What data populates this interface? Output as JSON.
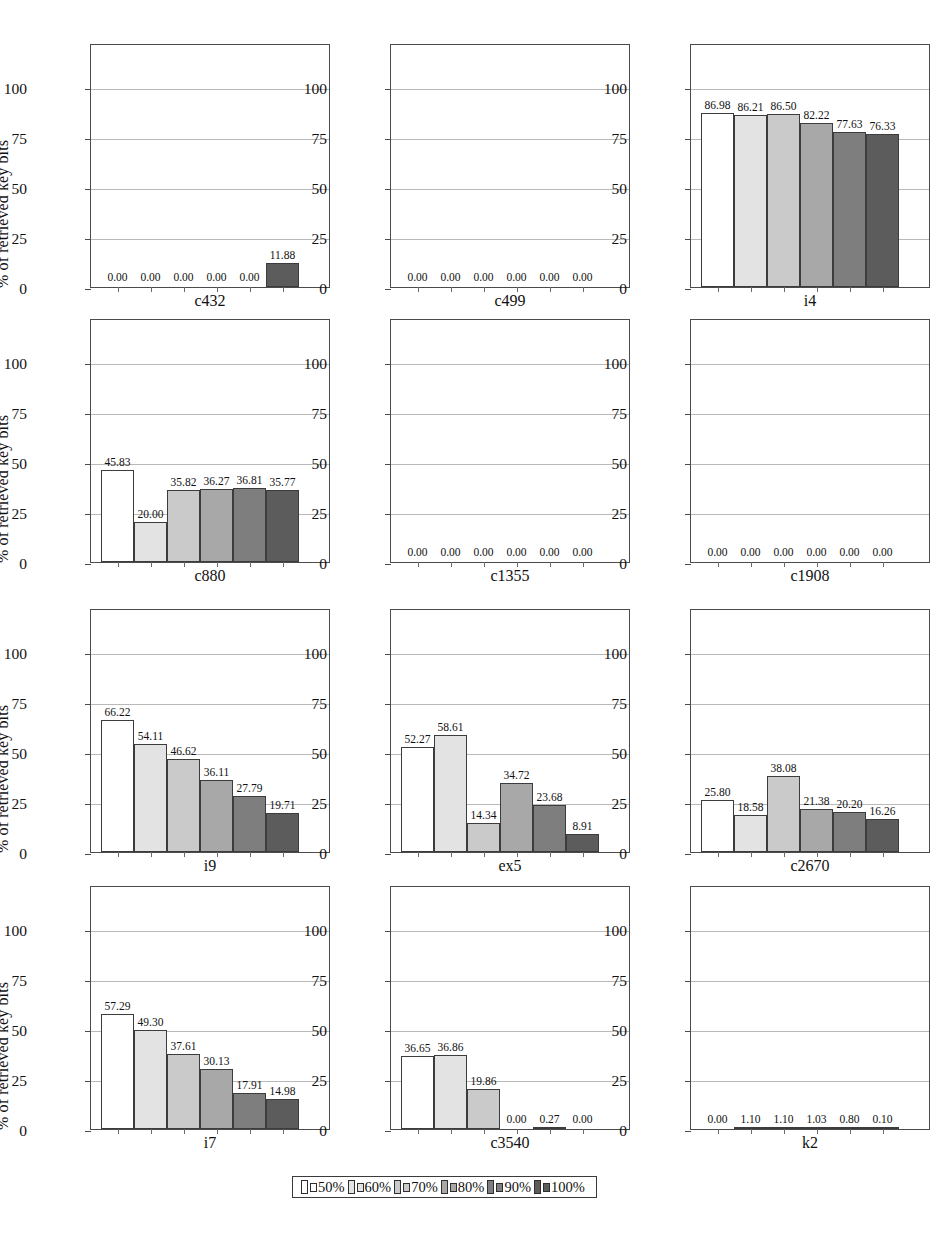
{
  "figure": {
    "ylabel": "% of retrieved key bits",
    "y_ticks": [
      "0",
      "25",
      "50",
      "75",
      "100"
    ],
    "y_tick_values": [
      0,
      25,
      50,
      75,
      100
    ],
    "ylim": [
      0,
      122
    ],
    "bar_shades": [
      "#ffffff",
      "#e3e3e3",
      "#cacaca",
      "#a8a8a8",
      "#7e7e7e",
      "#5c5c5c"
    ]
  },
  "legend": {
    "entries": [
      {
        "label": "50%",
        "color": "#ffffff"
      },
      {
        "label": "60%",
        "color": "#e3e3e3"
      },
      {
        "label": "70%",
        "color": "#cacaca"
      },
      {
        "label": "80%",
        "color": "#a8a8a8"
      },
      {
        "label": "90%",
        "color": "#7e7e7e"
      },
      {
        "label": "100%",
        "color": "#5c5c5c"
      }
    ]
  },
  "chart_data": {
    "type": "bar",
    "title": "",
    "xlabel": "",
    "ylabel": "% of retrieved key bits",
    "ylim": [
      0,
      122
    ],
    "grid": true,
    "legend_position": "bottom",
    "categories": [
      "50%",
      "60%",
      "70%",
      "80%",
      "90%",
      "100%"
    ],
    "panels": [
      {
        "name": "c432",
        "values": [
          0.0,
          0.0,
          0.0,
          0.0,
          0.0,
          11.88
        ],
        "labels": [
          "0.00",
          "0.00",
          "0.00",
          "0.00",
          "0.00",
          "11.88"
        ]
      },
      {
        "name": "c499",
        "values": [
          0.0,
          0.0,
          0.0,
          0.0,
          0.0,
          0.0
        ],
        "labels": [
          "0.00",
          "0.00",
          "0.00",
          "0.00",
          "0.00",
          "0.00"
        ]
      },
      {
        "name": "i4",
        "values": [
          86.98,
          86.21,
          86.5,
          82.22,
          77.63,
          76.33
        ],
        "labels": [
          "86.98",
          "86.21",
          "86.50",
          "82.22",
          "77.63",
          "76.33"
        ]
      },
      {
        "name": "c880",
        "values": [
          45.83,
          20.0,
          35.82,
          36.27,
          36.81,
          35.77
        ],
        "labels": [
          "45.83",
          "20.00",
          "35.82",
          "36.27",
          "36.81",
          "35.77"
        ]
      },
      {
        "name": "c1355",
        "values": [
          0.0,
          0.0,
          0.0,
          0.0,
          0.0,
          0.0
        ],
        "labels": [
          "0.00",
          "0.00",
          "0.00",
          "0.00",
          "0.00",
          "0.00"
        ]
      },
      {
        "name": "c1908",
        "values": [
          0.0,
          0.0,
          0.0,
          0.0,
          0.0,
          0.0
        ],
        "labels": [
          "0.00",
          "0.00",
          "0.00",
          "0.00",
          "0.00",
          "0.00"
        ]
      },
      {
        "name": "i9",
        "values": [
          66.22,
          54.11,
          46.62,
          36.11,
          27.79,
          19.71
        ],
        "labels": [
          "66.22",
          "54.11",
          "46.62",
          "36.11",
          "27.79",
          "19.71"
        ]
      },
      {
        "name": "ex5",
        "values": [
          52.27,
          58.61,
          14.34,
          34.72,
          23.68,
          8.91
        ],
        "labels": [
          "52.27",
          "58.61",
          "14.34",
          "34.72",
          "23.68",
          "8.91"
        ]
      },
      {
        "name": "c2670",
        "values": [
          25.8,
          18.58,
          38.08,
          21.38,
          20.2,
          16.26
        ],
        "labels": [
          "25.80",
          "18.58",
          "38.08",
          "21.38",
          "20.20",
          "16.26"
        ]
      },
      {
        "name": "i7",
        "values": [
          57.29,
          49.3,
          37.61,
          30.13,
          17.91,
          14.98
        ],
        "labels": [
          "57.29",
          "49.30",
          "37.61",
          "30.13",
          "17.91",
          "14.98"
        ]
      },
      {
        "name": "c3540",
        "values": [
          36.65,
          36.86,
          19.86,
          0.0,
          0.27,
          0.0
        ],
        "labels": [
          "36.65",
          "36.86",
          "19.86",
          "0.00",
          "0.27",
          "0.00"
        ]
      },
      {
        "name": "k2",
        "values": [
          0.0,
          1.1,
          1.1,
          1.03,
          0.8,
          0.1
        ],
        "labels": [
          "0.00",
          "1.10",
          "1.10",
          "1.03",
          "0.80",
          "0.10"
        ]
      }
    ]
  }
}
